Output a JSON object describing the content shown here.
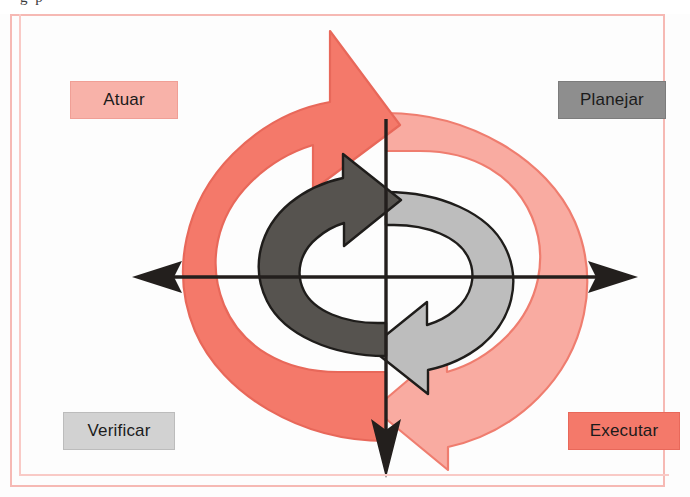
{
  "page": {
    "background_color": "#fdfdfd",
    "frame_color": "#f6b9b4",
    "cropped_header_text": "g                                            p"
  },
  "diagram": {
    "type": "pdca-cycle",
    "axes": {
      "horizontal": {
        "stroke_color": "#231f1d",
        "left_arrowhead": "arrow-left",
        "right_arrowhead": "arrow-right"
      },
      "vertical": {
        "stroke_color": "#231f1d",
        "bottom_arrowhead": "arrow-down"
      }
    },
    "arrows": [
      {
        "name": "outer-upper-left-arrow",
        "quadrant": "upper-left",
        "fill": "#f4796a",
        "stroke": "#e8685a",
        "points_to": "up-right"
      },
      {
        "name": "outer-lower-right-arrow",
        "quadrant": "lower-right",
        "fill": "#f9aba1",
        "stroke": "#ef7d6f",
        "points_to": "down-left"
      },
      {
        "name": "inner-left-arrow",
        "quadrant": "left",
        "fill": "#56534f",
        "stroke": "#1f1d1b",
        "points_to": "up-right"
      },
      {
        "name": "inner-right-arrow",
        "quadrant": "right",
        "fill": "#bdbdbd",
        "stroke": "#1f1d1b",
        "points_to": "down-left"
      }
    ]
  },
  "labels": {
    "act": {
      "text": "Atuar",
      "position": "top-left",
      "fill": "#f8b2a9",
      "shadow": "#ef7464"
    },
    "plan": {
      "text": "Planejar",
      "position": "top-right",
      "fill": "#8e8e8e",
      "shadow": "#3d3a38"
    },
    "check": {
      "text": "Verificar",
      "position": "bottom-left",
      "fill": "#d2d2d2",
      "shadow": "#2f2c2a"
    },
    "do": {
      "text": "Executar",
      "position": "bottom-right",
      "fill": "#f4796a",
      "shadow": "#f09a8d"
    }
  }
}
